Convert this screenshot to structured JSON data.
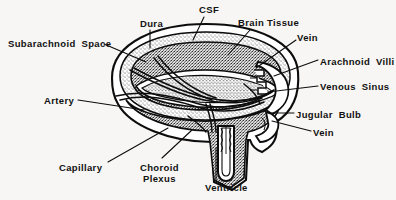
{
  "figure": {
    "background_color": "#f7f6f4",
    "ink_color": "#111111",
    "width": 396,
    "height": 200,
    "style": "scanned black-and-white line drawing with stipple and hatch shading"
  },
  "labels": [
    {
      "id": "subarachnoid-space",
      "text": "Subarachnoid  Space",
      "x": 8,
      "y": 38,
      "lines": 1
    },
    {
      "id": "dura",
      "text": "Dura",
      "x": 140,
      "y": 18,
      "lines": 1
    },
    {
      "id": "csf",
      "text": "CSF",
      "x": 199,
      "y": 4,
      "lines": 1
    },
    {
      "id": "brain-tissue",
      "text": "Brain Tissue",
      "x": 238,
      "y": 17,
      "lines": 1
    },
    {
      "id": "vein-upper",
      "text": "Vein",
      "x": 297,
      "y": 32,
      "lines": 1
    },
    {
      "id": "arachnoid-villi",
      "text": "Arachnoid  Villi",
      "x": 320,
      "y": 56,
      "lines": 1
    },
    {
      "id": "venous-sinus",
      "text": "Venous  Sinus",
      "x": 320,
      "y": 81,
      "lines": 1
    },
    {
      "id": "jugular-bulb",
      "text": "Jugular  Bulb",
      "x": 296,
      "y": 109,
      "lines": 1
    },
    {
      "id": "vein-lower",
      "text": "Vein",
      "x": 313,
      "y": 127,
      "lines": 1
    },
    {
      "id": "artery",
      "text": "Artery",
      "x": 44,
      "y": 95,
      "lines": 1
    },
    {
      "id": "capillary",
      "text": "Capillary",
      "x": 59,
      "y": 162,
      "lines": 1
    },
    {
      "id": "choroid-plexus",
      "text": "Choroid\nPlexus",
      "x": 140,
      "y": 162,
      "lines": 2
    },
    {
      "id": "ventricle",
      "text": "Ventricle",
      "x": 205,
      "y": 182,
      "lines": 1
    }
  ],
  "leader_lines": [
    {
      "id": "leader-subarachnoid-space",
      "from": [
        104,
        44
      ],
      "to": [
        146,
        62
      ]
    },
    {
      "id": "leader-dura",
      "from": [
        150,
        30
      ],
      "to": [
        150,
        48
      ]
    },
    {
      "id": "leader-csf",
      "from": [
        204,
        17
      ],
      "to": [
        193,
        40
      ]
    },
    {
      "id": "leader-brain-tissue",
      "from": [
        250,
        30
      ],
      "to": [
        228,
        55
      ]
    },
    {
      "id": "leader-vein-upper",
      "from": [
        296,
        40
      ],
      "to": [
        256,
        68
      ]
    },
    {
      "id": "leader-arachnoid-villi",
      "from": [
        318,
        60
      ],
      "to": [
        274,
        76
      ]
    },
    {
      "id": "leader-venous-sinus",
      "from": [
        318,
        86
      ],
      "to": [
        268,
        92
      ]
    },
    {
      "id": "leader-jugular-bulb",
      "from": [
        294,
        113
      ],
      "to": [
        268,
        113
      ]
    },
    {
      "id": "leader-vein-lower",
      "from": [
        311,
        131
      ],
      "to": [
        272,
        121
      ]
    },
    {
      "id": "leader-artery",
      "from": [
        78,
        100
      ],
      "to": [
        144,
        110
      ]
    },
    {
      "id": "leader-capillary",
      "from": [
        108,
        162
      ],
      "to": [
        168,
        128
      ]
    },
    {
      "id": "leader-choroid-plexus",
      "from": [
        162,
        158
      ],
      "to": [
        192,
        130
      ]
    },
    {
      "id": "leader-ventricle",
      "from": [
        216,
        180
      ],
      "to": [
        216,
        148
      ]
    }
  ],
  "structures": [
    {
      "id": "dura-outer-wall",
      "name": "Dura mater outer boundary",
      "shading": "solid black outline"
    },
    {
      "id": "subarachnoid-layer",
      "name": "Subarachnoid space",
      "shading": "fine stipple"
    },
    {
      "id": "brain-parenchyma",
      "name": "Brain tissue",
      "shading": "dense coarse stipple"
    },
    {
      "id": "ventricle-channel",
      "name": "Ventricle",
      "shading": "white lumen, dark walls"
    },
    {
      "id": "venous-sinus-body",
      "name": "Venous sinus",
      "shading": "white lumen with villi"
    },
    {
      "id": "arachnoid-villi-tufts",
      "name": "Arachnoid villi projections",
      "shading": "small notched outlines"
    },
    {
      "id": "jugular-bulb-body",
      "name": "Jugular bulb",
      "shading": "white lumen"
    },
    {
      "id": "vascular-network",
      "name": "Artery / capillary / vein lines",
      "shading": "curved line pairs"
    }
  ]
}
